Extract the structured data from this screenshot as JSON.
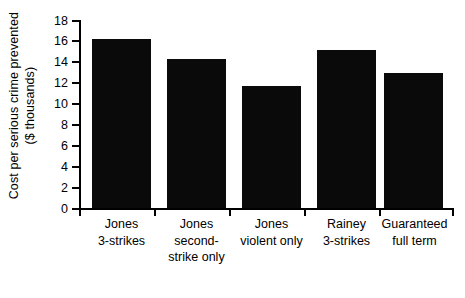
{
  "chart_data": {
    "type": "bar",
    "title": "",
    "subtitle": "",
    "xlabel": "",
    "ylabel": "Cost per serious crime prevented ($ thousands)",
    "ylabel_lines": [
      "Cost per serious crime prevented",
      "($ thousands)"
    ],
    "categories": [
      "Jones 3-strikes",
      "Jones second-strike only",
      "Jones violent only",
      "Rainey 3-strikes",
      "Guaranteed full term"
    ],
    "category_label_lines": [
      [
        "Jones",
        "3-strikes"
      ],
      [
        "Jones",
        "second-",
        "strike only"
      ],
      [
        "Jones",
        "violent only"
      ],
      [
        "Rainey",
        "3-strikes"
      ],
      [
        "Guaranteed",
        "full term"
      ]
    ],
    "values": [
      16.2,
      14.3,
      11.7,
      15.1,
      12.9
    ],
    "ylim": [
      0,
      18
    ],
    "ytick_values": [
      0,
      2,
      4,
      6,
      8,
      10,
      12,
      14,
      16,
      18
    ],
    "ytick_labels": [
      "0",
      "2",
      "4",
      "6",
      "8",
      "10",
      "12",
      "14",
      "16",
      "18"
    ],
    "grid": false,
    "legend": false,
    "legend_position": "none",
    "bar_color": "#0a0a0a",
    "axis_color": "#000000",
    "background_color": "#ffffff"
  }
}
